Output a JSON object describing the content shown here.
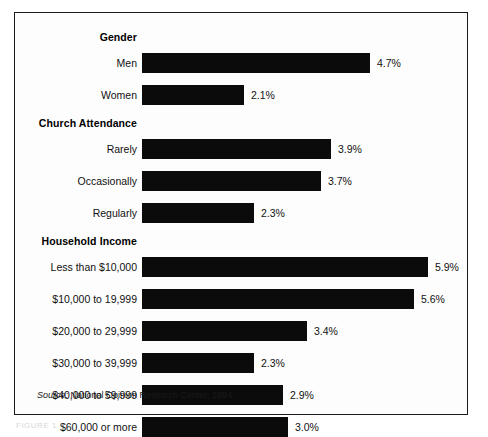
{
  "figure": {
    "source_prefix": "Source:",
    "source_text": " National Opinion Research Center, 1994.",
    "caption_partial": "FIGURE 1"
  },
  "chart_data": {
    "type": "bar",
    "orientation": "horizontal",
    "title": "",
    "xlabel": "",
    "ylabel": "",
    "xlim": [
      0,
      6.2
    ],
    "grid": false,
    "legend": "none",
    "value_suffix": "%",
    "px_per_unit": 48.5,
    "groups": [
      {
        "header": "Gender",
        "categories": [
          "Men",
          "Women"
        ],
        "values": [
          4.7,
          2.1
        ],
        "labels": [
          "4.7%",
          "2.1%"
        ]
      },
      {
        "header": "Church Attendance",
        "categories": [
          "Rarely",
          "Occasionally",
          "Regularly"
        ],
        "values": [
          3.9,
          3.7,
          2.3
        ],
        "labels": [
          "3.9%",
          "3.7%",
          "2.3%"
        ]
      },
      {
        "header": "Household Income",
        "categories": [
          "Less than $10,000",
          "$10,000 to 19,999",
          "$20,000 to 29,999",
          "$30,000 to 39,999",
          "$40,000 to 59,999",
          "$60,000 or more"
        ],
        "values": [
          5.9,
          5.6,
          3.4,
          2.3,
          2.9,
          3.0
        ],
        "labels": [
          "5.9%",
          "5.6%",
          "3.4%",
          "2.3%",
          "2.9%",
          "3.0%"
        ]
      }
    ]
  }
}
